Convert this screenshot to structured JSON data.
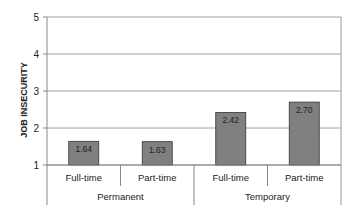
{
  "chart_data": {
    "type": "bar",
    "title": "",
    "xlabel": "",
    "ylabel": "JOB INSECURITY",
    "ylim": [
      1,
      5
    ],
    "yticks": [
      1,
      2,
      3,
      4,
      5
    ],
    "grid": true,
    "legend": null,
    "categories": [
      "Full-time",
      "Part-time",
      "Full-time",
      "Part-time"
    ],
    "groups": [
      {
        "label": "Permanent",
        "categories": [
          "Full-time",
          "Part-time"
        ]
      },
      {
        "label": "Temporary",
        "categories": [
          "Full-time",
          "Part-time"
        ]
      }
    ],
    "values": [
      1.64,
      1.63,
      2.42,
      2.7
    ],
    "value_labels": [
      "1.64",
      "1.63",
      "2.42",
      "2.70"
    ],
    "bar_color": "#808080",
    "bar_border_color": "#333333",
    "grid_color": "#a0a0a0"
  }
}
